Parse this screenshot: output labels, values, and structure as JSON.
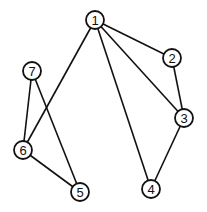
{
  "diagram": {
    "type": "undirected-graph",
    "node_radius": 9,
    "nodes": [
      {
        "id": "1",
        "label": "1",
        "x": 95,
        "y": 20
      },
      {
        "id": "2",
        "label": "2",
        "x": 172,
        "y": 58
      },
      {
        "id": "3",
        "label": "3",
        "x": 184,
        "y": 118
      },
      {
        "id": "4",
        "label": "4",
        "x": 151,
        "y": 189
      },
      {
        "id": "5",
        "label": "5",
        "x": 80,
        "y": 192
      },
      {
        "id": "6",
        "label": "6",
        "x": 23,
        "y": 150
      },
      {
        "id": "7",
        "label": "7",
        "x": 32,
        "y": 71
      }
    ],
    "edges": [
      {
        "from": "1",
        "to": "2"
      },
      {
        "from": "1",
        "to": "3"
      },
      {
        "from": "1",
        "to": "4"
      },
      {
        "from": "1",
        "to": "6"
      },
      {
        "from": "2",
        "to": "3"
      },
      {
        "from": "3",
        "to": "4"
      },
      {
        "from": "7",
        "to": "6"
      },
      {
        "from": "7",
        "to": "5"
      },
      {
        "from": "6",
        "to": "5"
      }
    ],
    "colors": {
      "stroke": "#111111",
      "background": "#ffffff"
    }
  }
}
